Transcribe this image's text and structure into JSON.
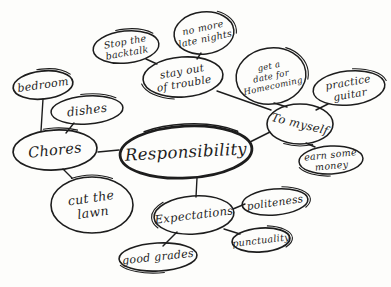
{
  "canvas": {
    "width": 391,
    "height": 287,
    "bg": "#fdfdfb",
    "ink": "#1d1d1d"
  },
  "diagram": {
    "type": "mindmap",
    "center_topic": "Responsibility",
    "nodes": [
      {
        "id": "responsibility",
        "label": "Responsibility",
        "lines": [
          "Responsibility"
        ],
        "cx": 186,
        "cy": 152,
        "rx": 66,
        "ry": 26,
        "tilt": -3,
        "stroke": 2.8,
        "font": 16.5,
        "textAngle": -3,
        "echoW": 1.6,
        "echo": {
          "start": 62,
          "len": 30
        }
      },
      {
        "id": "chores",
        "label": "Chores",
        "lines": [
          "Chores"
        ],
        "cx": 55,
        "cy": 150,
        "rx": 42,
        "ry": 20,
        "tilt": -3,
        "stroke": 1.7,
        "font": 14.5,
        "textAngle": -6,
        "echo": {
          "start": 70,
          "len": 16
        }
      },
      {
        "id": "bedroom",
        "label": "bedroom",
        "lines": [
          "bedroom"
        ],
        "cx": 43,
        "cy": 85,
        "rx": 30,
        "ry": 14,
        "tilt": -6,
        "stroke": 1.7,
        "font": 11,
        "textAngle": -8,
        "echo": {
          "start": 72,
          "len": 22
        }
      },
      {
        "id": "dishes",
        "label": "dishes",
        "lines": [
          "dishes"
        ],
        "cx": 87,
        "cy": 110,
        "rx": 36,
        "ry": 14,
        "tilt": -4,
        "stroke": 1.5,
        "font": 12,
        "textAngle": -7,
        "echo": {
          "start": 72,
          "len": 20
        }
      },
      {
        "id": "cut-the-lawn",
        "label": "cut the lawn",
        "lines": [
          "cut the",
          "lawn"
        ],
        "cx": 92,
        "cy": 205,
        "rx": 41,
        "ry": 28,
        "tilt": 0,
        "stroke": 1.6,
        "font": 12.5,
        "textAngle": -8,
        "echo": {
          "start": 66,
          "len": 18
        }
      },
      {
        "id": "stop-the-backtalk",
        "label": "Stop the backtalk",
        "lines": [
          "Stop the",
          "backtalk"
        ],
        "cx": 126,
        "cy": 47,
        "rx": 33,
        "ry": 16,
        "tilt": -6,
        "stroke": 1.5,
        "font": 9.5,
        "textAngle": -10,
        "echo": {
          "start": 70,
          "len": 22
        }
      },
      {
        "id": "no-more-late-nights",
        "label": "no more late nights",
        "lines": [
          "no more",
          "late nights"
        ],
        "cx": 204,
        "cy": 33,
        "rx": 30,
        "ry": 21,
        "tilt": -6,
        "stroke": 1.5,
        "font": 9.5,
        "textAngle": -12,
        "echo": {
          "start": 84,
          "len": 18
        }
      },
      {
        "id": "stay-out-of-trouble",
        "label": "stay out of trouble",
        "lines": [
          "stay out",
          "of trouble"
        ],
        "cx": 183,
        "cy": 77,
        "rx": 40,
        "ry": 20,
        "tilt": -4,
        "stroke": 1.6,
        "font": 10.5,
        "textAngle": -10,
        "echo": {
          "start": 30,
          "len": 18
        }
      },
      {
        "id": "get-a-date-for-homecoming",
        "label": "get a date for Homecoming",
        "lines": [
          "get a",
          "date for",
          "Homecoming"
        ],
        "cx": 271,
        "cy": 76,
        "rx": 35,
        "ry": 28,
        "tilt": -8,
        "stroke": 1.5,
        "font": 8.5,
        "textAngle": -12,
        "echo": {
          "start": 84,
          "len": 20
        }
      },
      {
        "id": "practice-guitar",
        "label": "practice guitar",
        "lines": [
          "practice",
          "guitar"
        ],
        "cx": 349,
        "cy": 88,
        "rx": 36,
        "ry": 17,
        "tilt": -6,
        "stroke": 1.5,
        "font": 10.5,
        "textAngle": -10,
        "echo": {
          "start": 78,
          "len": 20
        }
      },
      {
        "id": "to-myself",
        "label": "To myself",
        "lines": [
          "To myself"
        ],
        "cx": 300,
        "cy": 124,
        "rx": 33,
        "ry": 20,
        "tilt": 0,
        "stroke": 1.6,
        "font": 11.5,
        "textAngle": 14,
        "echo": {
          "start": 18,
          "len": 16
        }
      },
      {
        "id": "earn-some-money",
        "label": "earn some money",
        "lines": [
          "earn some",
          "money"
        ],
        "cx": 331,
        "cy": 160,
        "rx": 32,
        "ry": 14,
        "tilt": -3,
        "stroke": 1.5,
        "font": 9.5,
        "textAngle": -6,
        "echo": {
          "start": 26,
          "len": 20
        }
      },
      {
        "id": "expectations",
        "label": "Expectations",
        "lines": [
          "Expectations"
        ],
        "cx": 194,
        "cy": 215,
        "rx": 40,
        "ry": 19,
        "tilt": -4,
        "stroke": 1.6,
        "font": 11.5,
        "textAngle": -7,
        "echo": {
          "start": 44,
          "len": 16
        }
      },
      {
        "id": "politeness",
        "label": "politeness",
        "lines": [
          "politeness"
        ],
        "cx": 275,
        "cy": 202,
        "rx": 33,
        "ry": 13,
        "tilt": -5,
        "stroke": 1.6,
        "font": 10.5,
        "textAngle": -8,
        "echo": {
          "start": 80,
          "len": 26
        }
      },
      {
        "id": "punctuality",
        "label": "punctuality",
        "lines": [
          "punctuality"
        ],
        "cx": 261,
        "cy": 240,
        "rx": 29,
        "ry": 12,
        "tilt": -4,
        "stroke": 1.7,
        "font": 9.5,
        "textAngle": -7,
        "echo": {
          "start": 80,
          "len": 28
        }
      },
      {
        "id": "good-grades",
        "label": "good grades",
        "lines": [
          "good grades"
        ],
        "cx": 158,
        "cy": 257,
        "rx": 39,
        "ry": 14,
        "tilt": -3,
        "stroke": 1.6,
        "font": 11,
        "textAngle": -6,
        "echo": {
          "start": 22,
          "len": 24
        }
      }
    ],
    "edges": [
      {
        "from": "chores",
        "to": "responsibility",
        "x1": 98,
        "y1": 152,
        "x2": 119,
        "y2": 150
      },
      {
        "from": "responsibility",
        "to": "to-myself",
        "x1": 250,
        "y1": 142,
        "x2": 270,
        "y2": 132
      },
      {
        "from": "responsibility",
        "to": "expectations",
        "x1": 197,
        "y1": 178,
        "x2": 196,
        "y2": 197
      },
      {
        "from": "bedroom",
        "to": "chores",
        "x1": 43,
        "y1": 99,
        "x2": 41,
        "y2": 131
      },
      {
        "from": "dishes",
        "to": "chores",
        "x1": 74,
        "y1": 123,
        "x2": 66,
        "y2": 133
      },
      {
        "from": "chores",
        "to": "cut-the-lawn",
        "x1": 63,
        "y1": 169,
        "x2": 72,
        "y2": 178
      },
      {
        "from": "stay-out-of-trouble",
        "to": "to-myself",
        "x1": 217,
        "y1": 91,
        "x2": 271,
        "y2": 110
      },
      {
        "from": "get-a-date-for-homecoming",
        "to": "to-myself",
        "x1": 274,
        "y1": 103,
        "x2": 287,
        "y2": 107
      },
      {
        "from": "practice-guitar",
        "to": "to-myself",
        "x1": 328,
        "y1": 104,
        "x2": 316,
        "y2": 110
      },
      {
        "from": "to-myself",
        "to": "earn-some-money",
        "x1": 306,
        "y1": 143,
        "x2": 315,
        "y2": 147
      },
      {
        "from": "stop-the-backtalk",
        "to": "stay-out-of-trouble",
        "x1": 146,
        "y1": 59,
        "x2": 157,
        "y2": 64
      },
      {
        "from": "no-more-late-nights",
        "to": "stay-out-of-trouble",
        "x1": 201,
        "y1": 53,
        "x2": 197,
        "y2": 59
      },
      {
        "from": "expectations",
        "to": "politeness",
        "x1": 233,
        "y1": 209,
        "x2": 245,
        "y2": 204
      },
      {
        "from": "expectations",
        "to": "punctuality",
        "x1": 224,
        "y1": 229,
        "x2": 240,
        "y2": 234
      },
      {
        "from": "expectations",
        "to": "good-grades",
        "x1": 177,
        "y1": 232,
        "x2": 163,
        "y2": 246
      }
    ]
  }
}
